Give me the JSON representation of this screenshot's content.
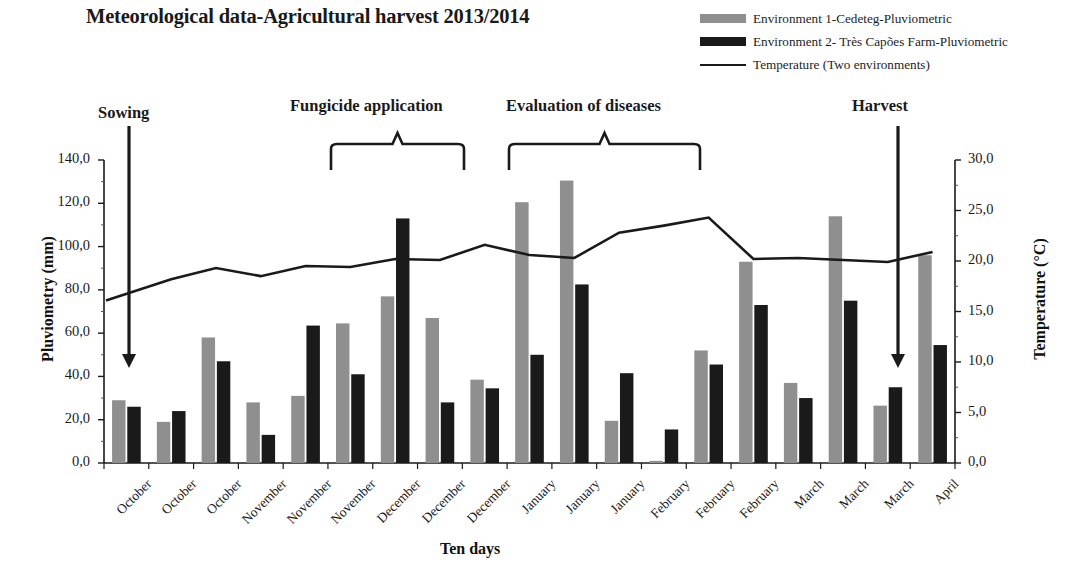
{
  "title": "Meteorological data-Agricultural harvest 2013/2014",
  "legend": [
    {
      "label": "Environment 1-Cedeteg-Pluviometric",
      "type": "bar",
      "color": "#8f8f8f",
      "name": "legend-env1"
    },
    {
      "label": "Environment 2- Très Capões Farm-Pluviometric",
      "type": "bar",
      "color": "#1a1a1a",
      "name": "legend-env2"
    },
    {
      "label": "Temperature (Two environments)",
      "type": "line",
      "color": "#1a1a1a",
      "name": "legend-temperature"
    }
  ],
  "annotations": [
    {
      "label": "Sowing",
      "marker": "arrow",
      "name": "annotation-sowing"
    },
    {
      "label": "Fungicide application",
      "marker": "bracket",
      "name": "annotation-fungicide-application"
    },
    {
      "label": "Evaluation of diseases",
      "marker": "bracket",
      "name": "annotation-evaluation-of-diseases"
    },
    {
      "label": "Harvest",
      "marker": "arrow",
      "name": "annotation-harvest"
    }
  ],
  "axes": {
    "left_title": "Pluviometry (mm)",
    "right_title": "Temperature (°C)",
    "x_title": "Ten days",
    "left_ticks": [
      "140,0",
      "120,0",
      "100,0",
      "80,0",
      "60,0",
      "40,0",
      "20,0",
      "0,0"
    ],
    "right_ticks": [
      "30,0",
      "25,0",
      "20,0",
      "15,0",
      "10,0",
      "5,0",
      "0,0"
    ]
  },
  "chart_data": {
    "type": "bar",
    "title": "Meteorological data-Agricultural harvest 2013/2014",
    "xlabel": "Ten days",
    "ylabel": "Pluviometry (mm)",
    "y2label": "Temperature (°C)",
    "ylim": [
      0,
      140
    ],
    "y2lim": [
      0,
      30
    ],
    "grid": false,
    "legend_position": "top-right",
    "categories": [
      "October",
      "October",
      "October",
      "November",
      "November",
      "November",
      "December",
      "December",
      "December",
      "January",
      "January",
      "January",
      "February",
      "February",
      "February",
      "March",
      "March",
      "March",
      "April"
    ],
    "series": [
      {
        "name": "Environment 1-Cedeteg-Pluviometric",
        "type": "bar",
        "color": "#8f8f8f",
        "axis": "left",
        "values": [
          29,
          19,
          58,
          28,
          31,
          64.5,
          77,
          67,
          38.5,
          120.5,
          130.5,
          19.5,
          1,
          52,
          93,
          37,
          114,
          26.5,
          96
        ]
      },
      {
        "name": "Environment 2- Très Capões Farm-Pluviometric",
        "type": "bar",
        "color": "#1a1a1a",
        "axis": "left",
        "values": [
          26,
          24,
          47,
          13,
          63.5,
          41,
          113,
          28,
          34.5,
          50,
          82.5,
          41.5,
          15.5,
          45.5,
          73,
          30,
          75,
          35,
          54.5
        ]
      },
      {
        "name": "Temperature (Two environments)",
        "type": "line",
        "color": "#1a1a1a",
        "axis": "right",
        "values": [
          16.1,
          18.2,
          19.3,
          18.5,
          19.5,
          19.4,
          20.2,
          20.1,
          21.6,
          20.6,
          20.3,
          22.8,
          23.5,
          24.3,
          20.2,
          20.3,
          20.1,
          19.9,
          20.9
        ]
      }
    ]
  }
}
